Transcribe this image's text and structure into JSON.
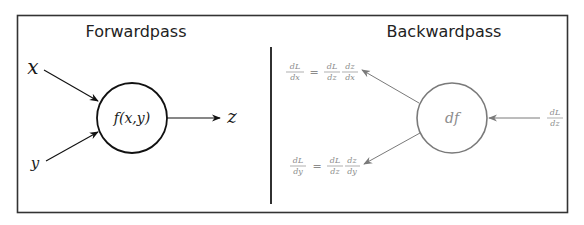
{
  "figure": {
    "type": "computational-graph-node",
    "colors": {
      "frame": "#333333",
      "forward": "#1a1a1a",
      "backward": "#8c8c8c",
      "background": "#ffffff"
    }
  },
  "forward": {
    "title": "Forwardpass",
    "inputs": [
      {
        "name": "x",
        "label": "x"
      },
      {
        "name": "y",
        "label": "y"
      }
    ],
    "node_label": "f(x,y)",
    "output": {
      "name": "z",
      "label": "z"
    }
  },
  "backward": {
    "title": "Backwardpass",
    "node_label": "df",
    "incoming_gradient": {
      "numerator": "dL",
      "denominator": "dz"
    },
    "gradient_x": {
      "lhs": {
        "numerator": "dL",
        "denominator": "dx"
      },
      "equals": "=",
      "rhs": [
        {
          "numerator": "dL",
          "denominator": "dz"
        },
        {
          "numerator": "dz",
          "denominator": "dx"
        }
      ]
    },
    "gradient_y": {
      "lhs": {
        "numerator": "dL",
        "denominator": "dy"
      },
      "equals": "=",
      "rhs": [
        {
          "numerator": "dL",
          "denominator": "dz"
        },
        {
          "numerator": "dz",
          "denominator": "dy"
        }
      ]
    }
  }
}
